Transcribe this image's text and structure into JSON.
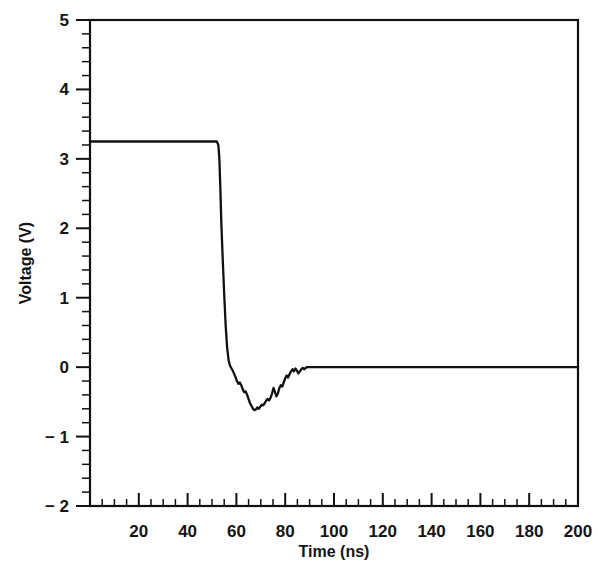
{
  "chart_data": {
    "type": "line",
    "title": "",
    "xlabel": "Time (ns)",
    "ylabel": "Voltage (V)",
    "xlim": [
      0,
      200
    ],
    "ylim": [
      -2,
      5
    ],
    "grid": false,
    "legend": null,
    "x_major_ticks": [
      0,
      20,
      40,
      60,
      80,
      100,
      120,
      140,
      160,
      180,
      200
    ],
    "x_tick_labels": [
      "",
      "20",
      "40",
      "60",
      "80",
      "100",
      "120",
      "140",
      "160",
      "180",
      "200"
    ],
    "x_minor_step": 5,
    "y_major_ticks": [
      -2,
      -1,
      0,
      1,
      2,
      3,
      4,
      5
    ],
    "y_tick_labels": [
      "− 2",
      "− 1",
      "0",
      "1",
      "2",
      "3",
      "4",
      "5"
    ],
    "y_minor_step": 0.2,
    "series": [
      {
        "name": "signal",
        "color": "#111111",
        "high_level_v": 3.25,
        "low_level_v": 0.0,
        "fall_start_ns": 53,
        "undershoot_min_v": -0.62,
        "undershoot_time_ns": 68,
        "settle_time_ns": 89,
        "x": [
          0,
          8,
          16,
          24,
          32,
          40,
          46,
          50,
          52,
          52.6,
          53,
          53.4,
          53.8,
          54.4,
          55,
          55.6,
          56.2,
          56.8,
          57.4,
          58,
          58.5,
          59,
          59.6,
          60.2,
          60.8,
          61.4,
          62,
          62.6,
          63.2,
          63.8,
          64.4,
          65,
          65.6,
          66.2,
          66.8,
          67.4,
          68,
          68.6,
          69.2,
          69.8,
          70.4,
          71,
          71.6,
          72.2,
          72.8,
          73.4,
          74,
          74.6,
          75.2,
          75.8,
          76.4,
          77,
          77.6,
          78.2,
          78.8,
          79.4,
          80,
          80.6,
          81.2,
          81.8,
          82.4,
          83,
          83.6,
          84.2,
          84.8,
          85.4,
          86,
          86.6,
          87.2,
          87.8,
          88.4,
          89,
          90,
          100,
          120,
          140,
          160,
          180,
          200
        ],
        "y": [
          3.25,
          3.25,
          3.25,
          3.25,
          3.25,
          3.25,
          3.25,
          3.25,
          3.25,
          3.2,
          3.02,
          2.6,
          2.1,
          1.55,
          1.05,
          0.6,
          0.28,
          0.1,
          0.02,
          -0.02,
          -0.05,
          -0.09,
          -0.14,
          -0.2,
          -0.24,
          -0.22,
          -0.26,
          -0.32,
          -0.36,
          -0.35,
          -0.4,
          -0.46,
          -0.52,
          -0.56,
          -0.6,
          -0.62,
          -0.61,
          -0.58,
          -0.6,
          -0.57,
          -0.54,
          -0.55,
          -0.52,
          -0.48,
          -0.46,
          -0.48,
          -0.44,
          -0.38,
          -0.3,
          -0.36,
          -0.42,
          -0.38,
          -0.3,
          -0.26,
          -0.28,
          -0.22,
          -0.16,
          -0.12,
          -0.15,
          -0.1,
          -0.06,
          -0.03,
          -0.06,
          -0.02,
          -0.05,
          -0.09,
          -0.06,
          -0.03,
          -0.01,
          -0.03,
          -0.01,
          0.0,
          0.0,
          0.0,
          0.0,
          0.0,
          0.0,
          0.0,
          0.0
        ]
      }
    ]
  }
}
